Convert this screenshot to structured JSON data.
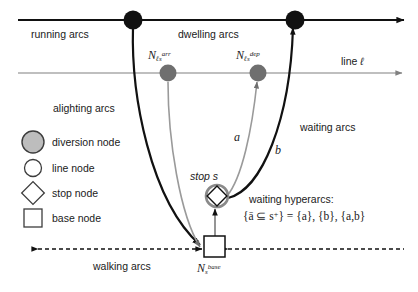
{
  "figure": {
    "colors": {
      "black": "#111111",
      "gray": "#808080",
      "light_gray": "#9a9a9a",
      "white": "#ffffff",
      "diversion_fill": "#bdbdbd",
      "background": "#ffffff"
    }
  },
  "arc_labels": {
    "running": "running arcs",
    "dwelling": "dwelling arcs",
    "alighting": "alighting arcs",
    "waiting": "waiting arcs",
    "walking": "walking arcs"
  },
  "line_label": {
    "text": "line",
    "symbol": "ℓ"
  },
  "nodes": {
    "arrival": {
      "base": "N",
      "sub": "ℓs",
      "sup": "arr"
    },
    "departure": {
      "base": "N",
      "sub": "ℓs",
      "sup": "dep"
    },
    "base": {
      "base": "N",
      "sub": "s",
      "sup": "base"
    },
    "stop": "stop s"
  },
  "hyperarc_branches": {
    "a": "a",
    "b": "b"
  },
  "hyperarcs": {
    "title": "waiting hyperarcs:",
    "formula_left": "{ā ⊆ s",
    "formula_sup": "+",
    "formula_right": "} = {a}, {b}, {a,b}"
  },
  "legend": {
    "items": [
      {
        "symbol": "filled-circle",
        "label": "diversion node"
      },
      {
        "symbol": "hollow-circle",
        "label": "line node"
      },
      {
        "symbol": "diamond",
        "label": "stop node"
      },
      {
        "symbol": "square",
        "label": "base node"
      }
    ]
  }
}
